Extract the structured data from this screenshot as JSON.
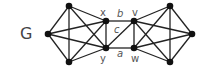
{
  "graph": {
    "name": "G",
    "name_pos": [
      20,
      39
    ],
    "colors": {
      "edge": "#222222",
      "node": "#111111",
      "label": "#555555"
    },
    "nodes": [
      {
        "id": "L1",
        "label": "",
        "x": 69,
        "y": 6
      },
      {
        "id": "L2",
        "label": "",
        "x": 48,
        "y": 34
      },
      {
        "id": "L3",
        "label": "",
        "x": 69,
        "y": 62
      },
      {
        "id": "x",
        "label": "x",
        "x": 106,
        "y": 21,
        "lx": 100,
        "ly": 16
      },
      {
        "id": "y",
        "label": "y",
        "x": 106,
        "y": 48,
        "lx": 100,
        "ly": 62
      },
      {
        "id": "v",
        "label": "v",
        "x": 134,
        "y": 21,
        "lx": 132,
        "ly": 16
      },
      {
        "id": "w",
        "label": "w",
        "x": 134,
        "y": 48,
        "lx": 131,
        "ly": 62
      },
      {
        "id": "R1",
        "label": "",
        "x": 170,
        "y": 6
      },
      {
        "id": "R2",
        "label": "",
        "x": 192,
        "y": 34
      },
      {
        "id": "R3",
        "label": "",
        "x": 170,
        "y": 62
      }
    ],
    "edges": [
      [
        "L1",
        "L2"
      ],
      [
        "L1",
        "L3"
      ],
      [
        "L1",
        "x"
      ],
      [
        "L1",
        "y"
      ],
      [
        "L2",
        "L3"
      ],
      [
        "L2",
        "x"
      ],
      [
        "L2",
        "y"
      ],
      [
        "L3",
        "x"
      ],
      [
        "L3",
        "y"
      ],
      [
        "x",
        "y"
      ],
      [
        "R1",
        "R2"
      ],
      [
        "R1",
        "R3"
      ],
      [
        "R1",
        "v"
      ],
      [
        "R1",
        "w"
      ],
      [
        "R2",
        "R3"
      ],
      [
        "R2",
        "v"
      ],
      [
        "R2",
        "w"
      ],
      [
        "R3",
        "v"
      ],
      [
        "R3",
        "w"
      ],
      [
        "v",
        "w"
      ],
      [
        "x",
        "v"
      ],
      [
        "y",
        "v"
      ],
      [
        "y",
        "w"
      ]
    ],
    "edge_labels": [
      {
        "text": "b",
        "x": 117,
        "y": 17
      },
      {
        "text": "c",
        "x": 114,
        "y": 33
      },
      {
        "text": "a",
        "x": 117,
        "y": 57
      }
    ]
  }
}
